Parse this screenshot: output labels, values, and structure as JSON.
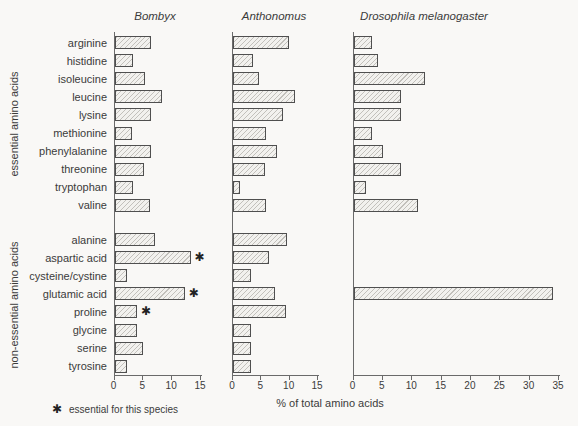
{
  "figure": {
    "background": "#f9f8f6",
    "text_color": "#3b3b3b",
    "axis_color": "#6a6a6a",
    "bar_border_color": "#4f4f4f",
    "bar_fill_color": "#f2f1ee",
    "bar_hatch_color": "#c2c0bb",
    "xlabel": "% of total amino acids",
    "legend": {
      "symbol": "✱",
      "text": "essential for this species"
    }
  },
  "groups": [
    {
      "label": "essential amino acids"
    },
    {
      "label": "non-essential amino acids"
    }
  ],
  "chart_data": {
    "type": "bar",
    "orientation": "horizontal",
    "title": "",
    "xlabel": "% of total amino acids",
    "footnote": "✱ essential for this species",
    "categories": [
      "arginine",
      "histidine",
      "isoleucine",
      "leucine",
      "lysine",
      "methionine",
      "phenylalanine",
      "threonine",
      "tryptophan",
      "valine",
      "alanine",
      "aspartic acid",
      "cysteine/cystine",
      "glutamic acid",
      "proline",
      "glycine",
      "serine",
      "tyrosine"
    ],
    "category_groups": [
      {
        "label": "essential amino acids",
        "members": [
          "arginine",
          "histidine",
          "isoleucine",
          "leucine",
          "lysine",
          "methionine",
          "phenylalanine",
          "threonine",
          "tryptophan",
          "valine"
        ]
      },
      {
        "label": "non-essential amino acids",
        "members": [
          "alanine",
          "aspartic acid",
          "cysteine/cystine",
          "glutamic acid",
          "proline",
          "glycine",
          "serine",
          "tyrosine"
        ]
      }
    ],
    "series": [
      {
        "name": "Bombyx",
        "xlim": [
          0,
          15
        ],
        "xticks": [
          0,
          5,
          10,
          15
        ],
        "values": [
          6.3,
          3.2,
          5.3,
          8.2,
          6.4,
          3.1,
          6.4,
          5.2,
          3.2,
          6.1,
          7.1,
          13.2,
          2.1,
          12.2,
          3.9,
          3.9,
          5.0,
          2.1
        ],
        "starred": [
          "aspartic acid",
          "glutamic acid",
          "proline"
        ]
      },
      {
        "name": "Anthonomus",
        "xlim": [
          0,
          15
        ],
        "xticks": [
          0,
          5,
          10,
          15
        ],
        "values": [
          9.9,
          3.5,
          4.6,
          11.0,
          8.9,
          5.8,
          7.7,
          5.6,
          1.3,
          5.8,
          9.5,
          6.3,
          3.1,
          7.4,
          9.4,
          3.1,
          3.1,
          3.1
        ],
        "starred": []
      },
      {
        "name": "Drosophila melanogaster",
        "xlim": [
          0,
          35
        ],
        "xticks": [
          0,
          5,
          10,
          15,
          20,
          25,
          30,
          35
        ],
        "values": [
          3.1,
          4.2,
          12.2,
          8.1,
          8.1,
          3.1,
          5.1,
          8.1,
          2.2,
          11.0,
          null,
          null,
          null,
          34.0,
          null,
          null,
          null,
          null
        ],
        "starred": []
      }
    ]
  }
}
